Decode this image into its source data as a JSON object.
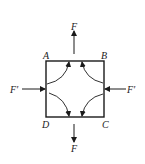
{
  "diagram": {
    "corners": {
      "A": "A",
      "B": "B",
      "C": "C",
      "D": "D"
    },
    "forces": {
      "top": "F",
      "bottom": "F",
      "left": "F′",
      "right": "F′"
    },
    "colors": {
      "stroke": "#1a1a1a",
      "background": "#ffffff"
    }
  }
}
